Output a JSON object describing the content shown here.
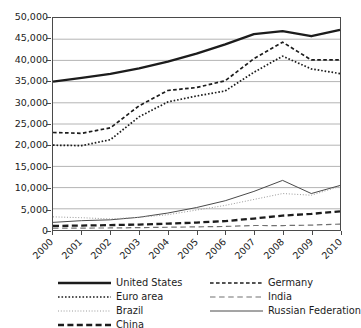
{
  "title_sliver": "",
  "axis": {
    "y_ticks": [
      "50,000",
      "45,000",
      "40,000",
      "35,000",
      "30,000",
      "25,000",
      "20,000",
      "15,000",
      "10,000",
      "5,000",
      "0"
    ],
    "x_ticks": [
      "2000",
      "2001",
      "2002",
      "2003",
      "2004",
      "2005",
      "2006",
      "2007",
      "2008",
      "2009",
      "2010"
    ]
  },
  "legend": {
    "items": [
      {
        "label": "United States",
        "style": "solid-thick"
      },
      {
        "label": "Euro area",
        "style": "dotted-bold"
      },
      {
        "label": "Brazil",
        "style": "dotted-fine"
      },
      {
        "label": "China",
        "style": "dashed-thick"
      },
      {
        "label": "Germany",
        "style": "dashed-medium"
      },
      {
        "label": "India",
        "style": "dashed-thin-long"
      },
      {
        "label": "Russian Federation",
        "style": "solid-thin"
      }
    ]
  },
  "chart_data": {
    "type": "line",
    "title": "",
    "xlabel": "",
    "ylabel": "",
    "ylim": [
      0,
      50000
    ],
    "ytick_step": 5000,
    "grid": true,
    "legend_position": "bottom",
    "x": [
      "2000",
      "2001",
      "2002",
      "2003",
      "2004",
      "2005",
      "2006",
      "2007",
      "2008",
      "2009",
      "2010"
    ],
    "series": [
      {
        "name": "United States",
        "style": "solid-thick",
        "color": "#1c1c1c",
        "width": 2.3,
        "values": [
          35000,
          35900,
          36800,
          38100,
          39700,
          41600,
          43800,
          46200,
          46900,
          45700,
          47200
        ]
      },
      {
        "name": "Germany",
        "style": "dashed-medium",
        "color": "#1c1c1c",
        "width": 1.7,
        "values": [
          23000,
          22800,
          24100,
          29300,
          32900,
          33600,
          35200,
          40400,
          44300,
          40100,
          40100
        ]
      },
      {
        "name": "Euro area",
        "style": "dotted-bold",
        "color": "#1c1c1c",
        "width": 1.7,
        "values": [
          20000,
          19900,
          21300,
          26700,
          30200,
          31600,
          32800,
          37200,
          41000,
          38000,
          36900
        ]
      },
      {
        "name": "Russian Federation",
        "style": "solid-thin",
        "color": "#4a4a4a",
        "width": 1.0,
        "values": [
          1800,
          2200,
          2400,
          3000,
          4000,
          5300,
          6900,
          9100,
          11700,
          8600,
          10500
        ]
      },
      {
        "name": "Brazil",
        "style": "dotted-fine",
        "color": "#9a9a9a",
        "width": 1.0,
        "values": [
          3100,
          2900,
          2600,
          3000,
          3600,
          4700,
          5800,
          7200,
          8600,
          8200,
          10300
        ]
      },
      {
        "name": "China",
        "style": "dashed-thick",
        "color": "#1c1c1c",
        "width": 2.3,
        "values": [
          950,
          1050,
          1150,
          1290,
          1500,
          1750,
          2100,
          2700,
          3400,
          3800,
          4400
        ]
      },
      {
        "name": "India",
        "style": "dashed-thin-long",
        "color": "#707070",
        "width": 1.2,
        "values": [
          450,
          460,
          480,
          560,
          650,
          740,
          830,
          1060,
          1050,
          1150,
          1400
        ]
      }
    ]
  }
}
